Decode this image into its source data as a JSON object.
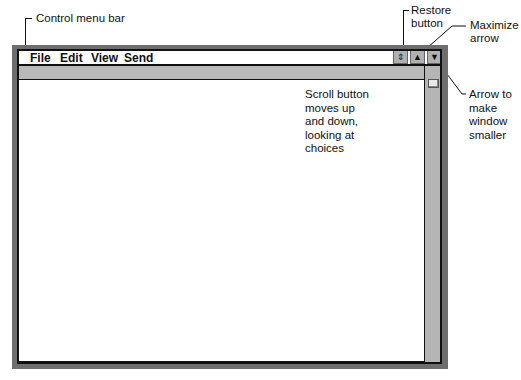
{
  "annotations": {
    "control_menu_bar": "Control menu bar",
    "restore_button": [
      "Restore",
      "button"
    ],
    "maximize_arrow": [
      "Maximize",
      "arrow"
    ],
    "arrow_smaller": [
      "Arrow to",
      "make",
      "window",
      "smaller"
    ],
    "scroll_button": [
      "Scroll button",
      "moves up",
      "and down,",
      "looking at",
      "choices"
    ]
  },
  "window": {
    "menu": [
      {
        "label": "File"
      },
      {
        "label": "Edit"
      },
      {
        "label": "View"
      },
      {
        "label": "Send"
      }
    ],
    "controls": {
      "restore_glyph": "⇕",
      "maximize_glyph": "▲",
      "minimize_glyph": "▼"
    }
  },
  "colors": {
    "frame": "#6e6e6e",
    "bar": "#b9b9b9",
    "scrollbar": "#b5b5b5"
  }
}
